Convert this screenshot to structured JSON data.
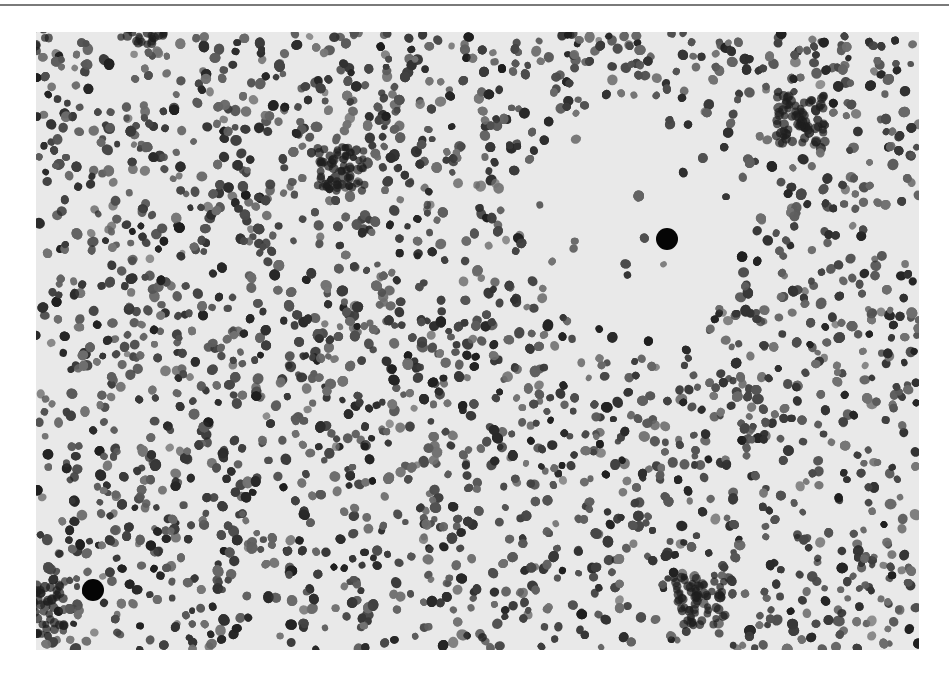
{
  "figure": {
    "kind": "grayscale light micrograph",
    "background_color": "#e9e9e9",
    "nucleus_color": "#3a3a3a",
    "rule_color": "#7a7a7a",
    "frame": {
      "x": 36,
      "y": 32,
      "width": 883,
      "height": 618
    },
    "pale_region": {
      "cx": 640,
      "cy": 215,
      "r": 120
    },
    "markers": [
      {
        "name": "marker-dot-upper-right",
        "cx": 667,
        "cy": 239,
        "r": 11
      },
      {
        "name": "marker-dot-lower-left",
        "cx": 93,
        "cy": 590,
        "r": 11
      }
    ]
  }
}
